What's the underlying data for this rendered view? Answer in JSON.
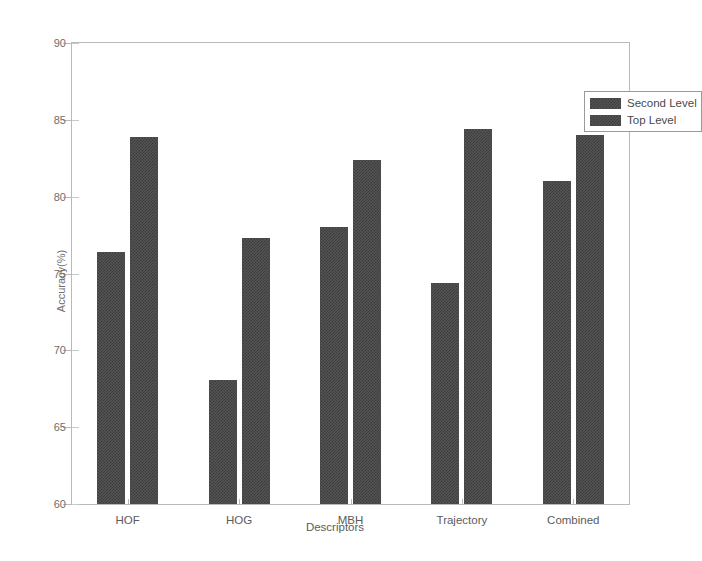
{
  "chart_data": {
    "type": "bar",
    "title": "",
    "xlabel": "Descriptors",
    "ylabel": "Accuracy(%)",
    "categories": [
      "HOF",
      "HOG",
      "MBH",
      "Trajectory",
      "Combined"
    ],
    "series": [
      {
        "name": "Second Level",
        "values": [
          76.4,
          68.1,
          78.0,
          74.4,
          81.0
        ]
      },
      {
        "name": "Top Level",
        "values": [
          83.9,
          77.3,
          82.4,
          84.4,
          84.0
        ]
      }
    ],
    "ylim": [
      60,
      90
    ],
    "yticks": [
      60,
      65,
      70,
      75,
      80,
      85,
      90
    ],
    "ytick_labels": [
      "60",
      "65",
      "70",
      "75",
      "80",
      "85",
      "90"
    ],
    "grid": false,
    "legend_position": "top-right",
    "bar_color": "#555555",
    "bar_pattern": "checkerboard-dither",
    "axis_color": "#b9b9b9",
    "text_color": "#5b5b5b"
  },
  "legend": {
    "items": [
      {
        "label": "Second Level"
      },
      {
        "label": "Top Level"
      }
    ]
  },
  "axes": {
    "x_title": "Descriptors",
    "y_title": "Accuracy(%)"
  }
}
